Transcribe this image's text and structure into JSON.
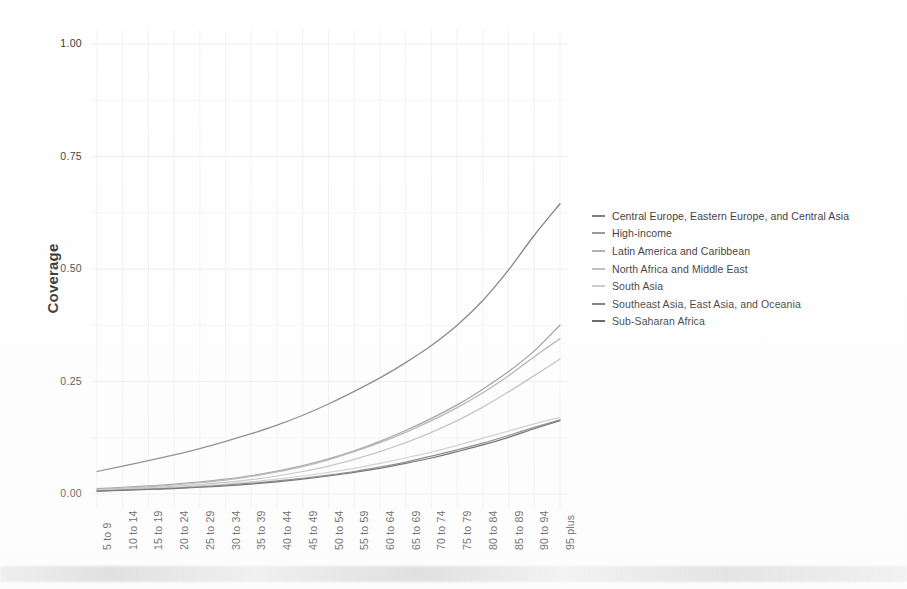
{
  "chart_data": {
    "type": "line",
    "title": "",
    "subtitle": "",
    "xlabel": "",
    "ylabel": "Coverage",
    "ylim": [
      0.0,
      1.0
    ],
    "yticks": [
      "0.00",
      "0.25",
      "0.50",
      "0.75",
      "1.00"
    ],
    "ytick_values": [
      0.0,
      0.25,
      0.5,
      0.75,
      1.0
    ],
    "grid": true,
    "legend_position": "right",
    "categories": [
      "5 to 9",
      "10 to 14",
      "15 to 19",
      "20 to 24",
      "25 to 29",
      "30 to 34",
      "35 to 39",
      "40 to 44",
      "45 to 49",
      "50 to 54",
      "55 to 59",
      "60 to 64",
      "65 to 69",
      "70 to 74",
      "75 to 79",
      "80 to 84",
      "85 to 89",
      "90 to 94",
      "95 plus"
    ],
    "series": [
      {
        "name": "Central Europe, Eastern Europe, and Central Asia",
        "color": "#6e6e6e",
        "values": [
          0.05,
          0.062,
          0.074,
          0.087,
          0.101,
          0.117,
          0.134,
          0.153,
          0.175,
          0.2,
          0.228,
          0.258,
          0.292,
          0.33,
          0.375,
          0.43,
          0.498,
          0.575,
          0.645
        ]
      },
      {
        "name": "High-income",
        "color": "#8a8a8a",
        "values": [
          0.012,
          0.015,
          0.018,
          0.022,
          0.027,
          0.033,
          0.041,
          0.051,
          0.063,
          0.078,
          0.096,
          0.117,
          0.141,
          0.168,
          0.198,
          0.233,
          0.272,
          0.318,
          0.375
        ]
      },
      {
        "name": "Latin America and Caribbean",
        "color": "#a3a3a3",
        "values": [
          0.01,
          0.013,
          0.016,
          0.02,
          0.025,
          0.031,
          0.039,
          0.049,
          0.061,
          0.076,
          0.094,
          0.114,
          0.137,
          0.163,
          0.192,
          0.225,
          0.263,
          0.305,
          0.345
        ]
      },
      {
        "name": "North Africa and Middle East",
        "color": "#b5b5b5",
        "values": [
          0.009,
          0.011,
          0.014,
          0.017,
          0.021,
          0.026,
          0.032,
          0.04,
          0.05,
          0.062,
          0.077,
          0.094,
          0.114,
          0.137,
          0.163,
          0.193,
          0.227,
          0.263,
          0.3
        ]
      },
      {
        "name": "South Asia",
        "color": "#c4c4c4",
        "values": [
          0.008,
          0.01,
          0.012,
          0.015,
          0.018,
          0.022,
          0.027,
          0.033,
          0.04,
          0.048,
          0.057,
          0.068,
          0.08,
          0.093,
          0.108,
          0.124,
          0.14,
          0.156,
          0.17
        ]
      },
      {
        "name": "Southeast Asia, East Asia, and Oceania",
        "color": "#6b6b6b",
        "values": [
          0.007,
          0.009,
          0.011,
          0.013,
          0.016,
          0.02,
          0.024,
          0.029,
          0.035,
          0.042,
          0.05,
          0.06,
          0.071,
          0.084,
          0.098,
          0.113,
          0.13,
          0.148,
          0.165
        ]
      },
      {
        "name": "Sub-Saharan Africa",
        "color": "#4a4a4a",
        "values": [
          0.006,
          0.008,
          0.01,
          0.012,
          0.015,
          0.018,
          0.022,
          0.027,
          0.033,
          0.04,
          0.048,
          0.057,
          0.068,
          0.08,
          0.094,
          0.109,
          0.126,
          0.145,
          0.163
        ]
      }
    ]
  }
}
